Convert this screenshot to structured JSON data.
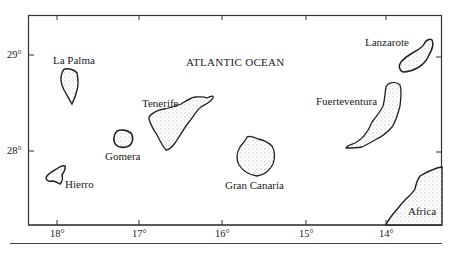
{
  "map": {
    "title": "Canary Islands",
    "ocean_label": "ATLANTIC OCEAN",
    "latitude_labels": [
      "29°",
      "28°"
    ],
    "longitude_labels": [
      "18°",
      "17°",
      "16°",
      "15°",
      "14°"
    ],
    "islands": [
      {
        "name": "La Palma"
      },
      {
        "name": "Tenerife"
      },
      {
        "name": "Gomera"
      },
      {
        "name": "Hierro"
      },
      {
        "name": "Gran Canaria"
      },
      {
        "name": "Fuerteventura"
      },
      {
        "name": "Lanzarote"
      }
    ],
    "continent_label": "Africa",
    "colors": {
      "ink": "#1a1a1a",
      "frame": "#333333",
      "background": "#ffffff"
    }
  }
}
